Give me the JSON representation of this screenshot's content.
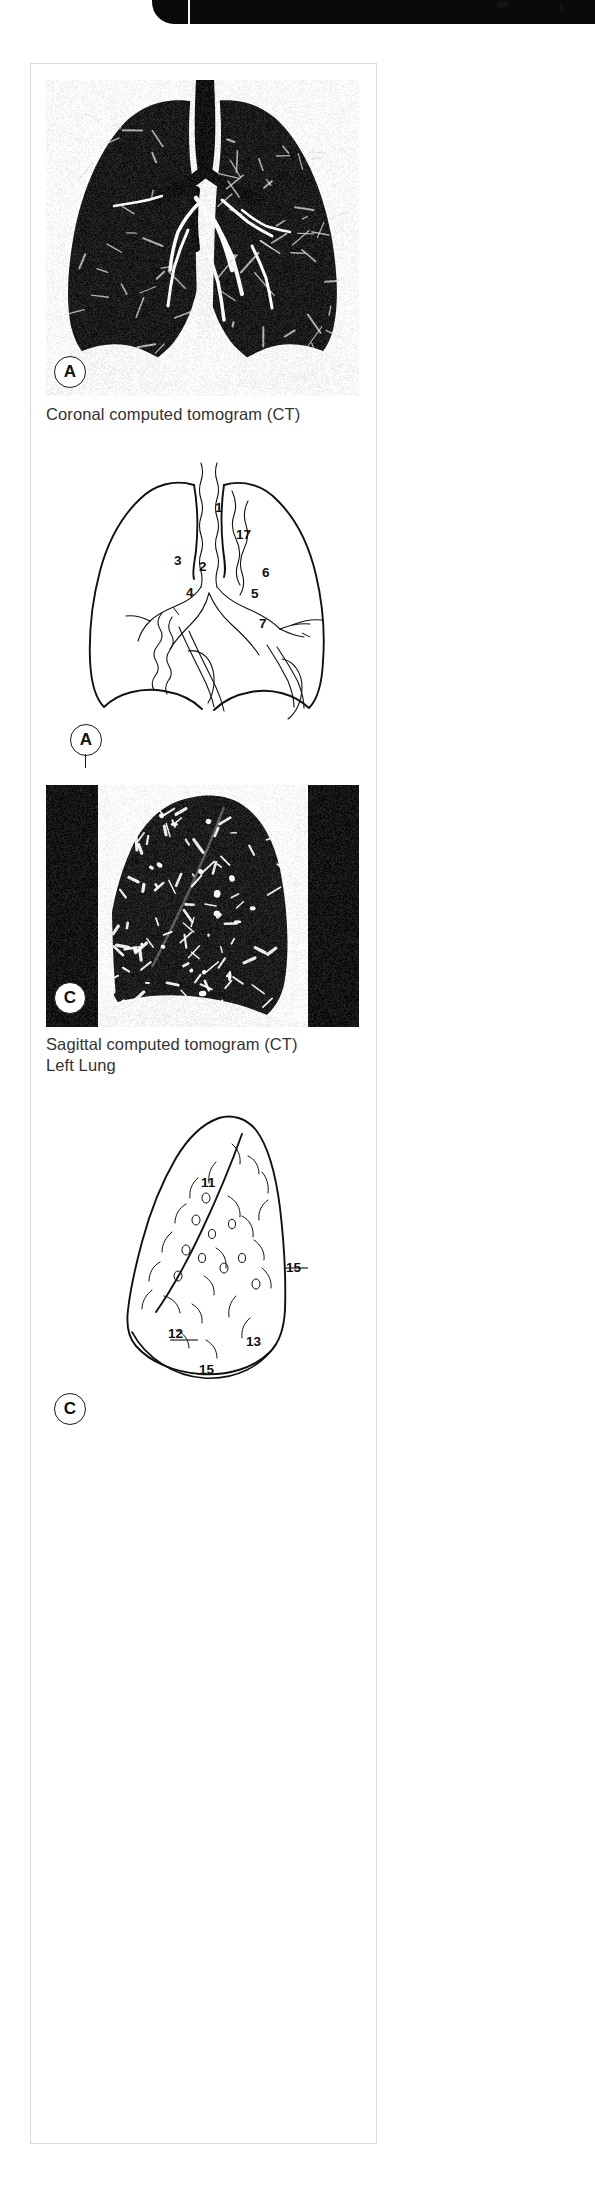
{
  "document": {
    "kind": "anatomy-atlas-figure",
    "header_band": {
      "visible": true
    }
  },
  "panels": [
    {
      "id": "A",
      "type": "ct-image",
      "letter": "A",
      "modality": "Coronal computed tomogram (CT)",
      "caption": "Coronal computed tomogram (CT)",
      "caption_line2": ""
    },
    {
      "id": "A-diagram",
      "type": "line-diagram",
      "letter": "A",
      "title": "Coronal line drawing with numbered structures",
      "labels": [
        {
          "n": "1",
          "x": 218,
          "y": 512
        },
        {
          "n": "17",
          "x": 240,
          "y": 538
        },
        {
          "n": "3",
          "x": 176,
          "y": 564
        },
        {
          "n": "2",
          "x": 201,
          "y": 570
        },
        {
          "n": "6",
          "x": 265,
          "y": 574
        },
        {
          "n": "4",
          "x": 188,
          "y": 596
        },
        {
          "n": "5",
          "x": 253,
          "y": 595
        },
        {
          "n": "7",
          "x": 261,
          "y": 625
        }
      ]
    },
    {
      "id": "C",
      "type": "ct-image",
      "letter": "C",
      "modality": "Sagittal computed tomogram (CT)",
      "caption": "Sagittal computed tomogram (CT)",
      "caption_line2": "Left Lung"
    },
    {
      "id": "C-diagram",
      "type": "line-diagram",
      "letter": "C",
      "title": "Sagittal left lung line drawing with numbered structures",
      "labels": [
        {
          "n": "11",
          "x": 207,
          "y": 1728
        },
        {
          "n": "15",
          "x": 289,
          "y": 1767
        },
        {
          "n": "12",
          "x": 172,
          "y": 1859
        },
        {
          "n": "13",
          "x": 250,
          "y": 1871
        },
        {
          "n": "15",
          "x": 203,
          "y": 1893
        }
      ]
    }
  ],
  "captions": {
    "coronal": "Coronal computed tomogram (CT)",
    "sagittal_line1": "Sagittal computed tomogram (CT)",
    "sagittal_line2": "Left Lung"
  },
  "letters": {
    "a_ct": "A",
    "a_diagram": "A",
    "c_ct": "C",
    "c_diagram": "C"
  },
  "numbers": {
    "coronal": [
      "1",
      "17",
      "3",
      "2",
      "6",
      "4",
      "5",
      "7"
    ],
    "sagittal": [
      "11",
      "15",
      "12",
      "13",
      "15"
    ]
  },
  "colors": {
    "page_background": "#ffffff",
    "frame_border": "#d9d9d9",
    "header_bar": "#0a0a0a",
    "caption_text": "#333333",
    "line_art": "#111111",
    "ct_dark": "#111111",
    "ct_light": "#f4f4f4"
  }
}
